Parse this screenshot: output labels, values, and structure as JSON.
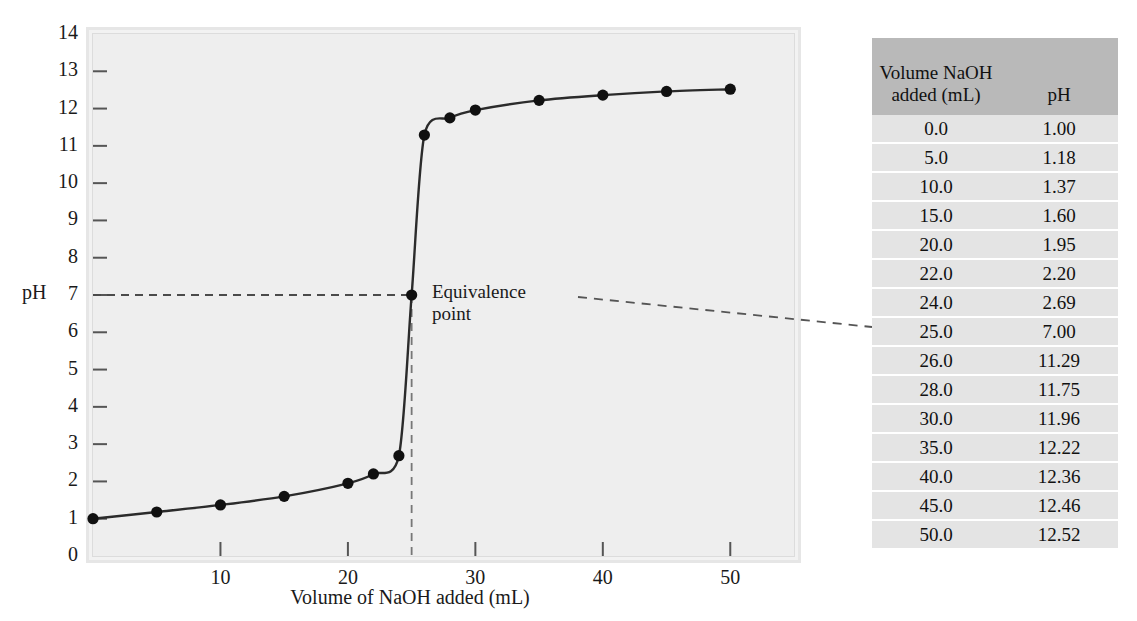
{
  "chart_data": {
    "type": "line",
    "title": "",
    "xlabel": "Volume of NaOH added (mL)",
    "ylabel": "pH",
    "xlim": [
      0,
      55
    ],
    "ylim": [
      0,
      14
    ],
    "xticks": [
      10,
      20,
      30,
      40,
      50
    ],
    "yticks": [
      0,
      1,
      2,
      3,
      4,
      5,
      6,
      7,
      8,
      9,
      10,
      11,
      12,
      13,
      14
    ],
    "grid": false,
    "legend": "none",
    "marker": "filled-circle",
    "line_color": "#2b2b2b",
    "marker_color": "#101010",
    "plot_background": "#eeeeee",
    "x": [
      0.0,
      5.0,
      10.0,
      15.0,
      20.0,
      22.0,
      24.0,
      25.0,
      26.0,
      28.0,
      30.0,
      35.0,
      40.0,
      45.0,
      50.0
    ],
    "values": [
      1.0,
      1.18,
      1.37,
      1.6,
      1.95,
      2.2,
      2.69,
      7.0,
      11.29,
      11.75,
      11.96,
      12.22,
      12.36,
      12.46,
      12.52
    ],
    "series": [
      {
        "name": "Titration of strong acid with NaOH",
        "x": [
          0.0,
          5.0,
          10.0,
          15.0,
          20.0,
          22.0,
          24.0,
          25.0,
          26.0,
          28.0,
          30.0,
          35.0,
          40.0,
          45.0,
          50.0
        ],
        "values": [
          1.0,
          1.18,
          1.37,
          1.6,
          1.95,
          2.2,
          2.69,
          7.0,
          11.29,
          11.75,
          11.96,
          12.22,
          12.36,
          12.46,
          12.52
        ]
      }
    ],
    "annotations": [
      {
        "label": "Equivalence\npoint",
        "x": 25.0,
        "y": 7.0,
        "guide_lines": [
          "horizontal-dashed-at-pH-7",
          "vertical-dashed-at-25-mL"
        ],
        "leader_to": "table-row-25.0"
      }
    ]
  },
  "axes": {
    "y_title": "pH",
    "x_title": "Volume of NaOH added (mL)",
    "y_tick_labels": [
      "14",
      "13",
      "12",
      "11",
      "10",
      "9",
      "8",
      "7",
      "6",
      "5",
      "4",
      "3",
      "2",
      "1",
      "0"
    ],
    "x_tick_labels": [
      "10",
      "20",
      "30",
      "40",
      "50"
    ]
  },
  "annotation": {
    "equivalence_label": "Equivalence\npoint"
  },
  "table": {
    "headers": {
      "volume": "Volume NaOH\nadded (mL)",
      "ph": "pH"
    },
    "rows": [
      {
        "volume": "0.0",
        "ph": "1.00"
      },
      {
        "volume": "5.0",
        "ph": "1.18"
      },
      {
        "volume": "10.0",
        "ph": "1.37"
      },
      {
        "volume": "15.0",
        "ph": "1.60"
      },
      {
        "volume": "20.0",
        "ph": "1.95"
      },
      {
        "volume": "22.0",
        "ph": "2.20"
      },
      {
        "volume": "24.0",
        "ph": "2.69"
      },
      {
        "volume": "25.0",
        "ph": "7.00"
      },
      {
        "volume": "26.0",
        "ph": "11.29"
      },
      {
        "volume": "28.0",
        "ph": "11.75"
      },
      {
        "volume": "30.0",
        "ph": "11.96"
      },
      {
        "volume": "35.0",
        "ph": "12.22"
      },
      {
        "volume": "40.0",
        "ph": "12.36"
      },
      {
        "volume": "45.0",
        "ph": "12.46"
      },
      {
        "volume": "50.0",
        "ph": "12.52"
      }
    ]
  },
  "colors": {
    "header_bg": "#b9b9b9",
    "row_bg": "#e4e4e4",
    "plot_bg": "#eeeeee",
    "curve": "#2b2b2b"
  }
}
